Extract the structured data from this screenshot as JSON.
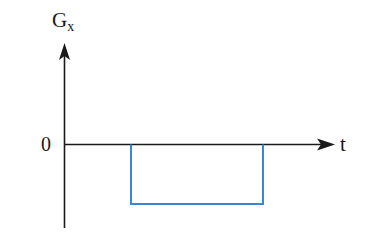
{
  "diagram": {
    "type": "gradient-pulse-timing",
    "y_axis": {
      "label": "G",
      "subscript": "x"
    },
    "x_axis": {
      "label": "t"
    },
    "origin_label": "0",
    "pulse": {
      "polarity": "negative",
      "color": "#3a86d4",
      "start_x": 131,
      "end_x": 263,
      "level_y": 204
    },
    "axis_color": "#1a1a1a"
  }
}
